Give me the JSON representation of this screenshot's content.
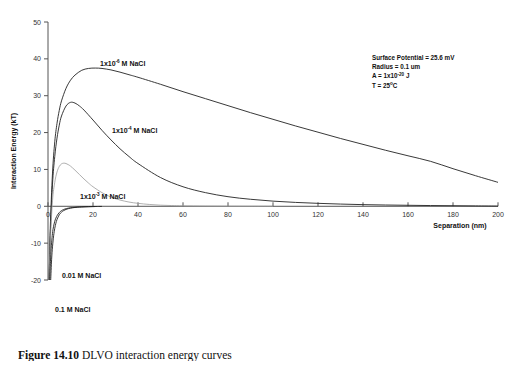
{
  "figure": {
    "caption_label": "Figure 14.10",
    "caption_text": "  DLVO interaction energy curves"
  },
  "chart_data": {
    "type": "line",
    "title": "",
    "xlabel": "Separation (nm)",
    "ylabel": "Interaction Energy (kT)",
    "xlim": [
      0,
      200
    ],
    "ylim": [
      -20,
      50
    ],
    "xticks": [
      0,
      20,
      40,
      60,
      80,
      100,
      120,
      140,
      160,
      180,
      200
    ],
    "yticks": [
      -20,
      -10,
      0,
      10,
      20,
      30,
      40,
      50
    ],
    "grid": false,
    "legend_position": "inline-annotations",
    "series": [
      {
        "name": "1x10-6 M NaCl",
        "label_html": "1x10<sup>-6</sup> M NaCl",
        "color": "#222222",
        "x": [
          0.5,
          1,
          2,
          3,
          4,
          5,
          6,
          8,
          10,
          12,
          15,
          18,
          21,
          24,
          28,
          32,
          36,
          40,
          50,
          60,
          70,
          80,
          90,
          100,
          110,
          120,
          130,
          140,
          150,
          160,
          170,
          180,
          190,
          200
        ],
        "y": [
          -20,
          -6,
          9,
          17.5,
          22.5,
          26,
          28.6,
          32,
          34.2,
          35.6,
          36.9,
          37.4,
          37.5,
          37.4,
          37.0,
          36.4,
          35.7,
          35.0,
          33.1,
          31.1,
          29.2,
          27.3,
          25.4,
          23.6,
          21.8,
          20.1,
          18.4,
          16.8,
          15.2,
          13.7,
          12.2,
          10.2,
          8.3,
          6.5
        ]
      },
      {
        "name": "1x10-4 M NaCl",
        "label_html": "1x10<sup>-4</sup> M NaCl",
        "color": "#222222",
        "x": [
          0.5,
          1,
          2,
          3,
          4,
          5,
          6,
          8,
          10,
          12,
          14,
          16,
          20,
          24,
          28,
          32,
          36,
          40,
          50,
          60,
          70,
          80,
          90,
          100,
          110,
          120,
          130,
          140,
          150,
          160,
          170,
          180,
          190,
          200
        ],
        "y": [
          -20,
          -8,
          6,
          13.5,
          18.5,
          22,
          24.5,
          27.2,
          28.2,
          28.0,
          27.2,
          26.1,
          23.4,
          20.6,
          18.0,
          15.6,
          13.5,
          11.6,
          7.8,
          5.3,
          3.7,
          2.6,
          1.9,
          1.4,
          1.05,
          0.8,
          0.6,
          0.45,
          0.35,
          0.27,
          0.2,
          0.15,
          0.1,
          0.05
        ]
      },
      {
        "name": "1x10-3 M NaCl",
        "label_html": "1x10<sup>-3</sup> M NaCl",
        "color": "#9a9a9a",
        "x": [
          0.5,
          1,
          2,
          3,
          4,
          5,
          6,
          7,
          8,
          9,
          10,
          12,
          14,
          16,
          18,
          20,
          24,
          28,
          32,
          36,
          40,
          45,
          50,
          55,
          60,
          70,
          80,
          90,
          100
        ],
        "y": [
          -20,
          -10,
          1.5,
          6.5,
          9.3,
          10.8,
          11.5,
          11.7,
          11.6,
          11.3,
          10.9,
          9.8,
          8.6,
          7.4,
          6.3,
          5.3,
          3.7,
          2.5,
          1.7,
          1.15,
          0.8,
          0.5,
          0.3,
          0.2,
          0.13,
          0.06,
          0.03,
          0.01,
          0.0
        ]
      },
      {
        "name": "0.01 M NaCl",
        "label_html": "0.01 M NaCl",
        "color": "#222222",
        "x": [
          1.2,
          1.6,
          2,
          2.5,
          3,
          3.5,
          4,
          5,
          6,
          7,
          8,
          9,
          10,
          11,
          12,
          13,
          14,
          16,
          18,
          20,
          22,
          24
        ],
        "y": [
          -20,
          -14.5,
          -11,
          -8,
          -6,
          -4.6,
          -3.6,
          -2.3,
          -1.6,
          -1.15,
          -0.85,
          -0.65,
          -0.5,
          -0.4,
          -0.32,
          -0.26,
          -0.21,
          -0.14,
          -0.1,
          -0.07,
          -0.05,
          -0.03
        ]
      },
      {
        "name": "0.1 M NaCl",
        "label_html": "0.1 M NaCl",
        "color": "#222222",
        "x": [
          0.8,
          1.1,
          1.4,
          1.8,
          2.2,
          2.7,
          3.2,
          3.8,
          4.5,
          5.5,
          6.5,
          7.5,
          9,
          11,
          13,
          15,
          18,
          21
        ],
        "y": [
          -20,
          -15,
          -11.5,
          -8.5,
          -6.4,
          -4.8,
          -3.7,
          -2.8,
          -2.1,
          -1.4,
          -1.0,
          -0.75,
          -0.5,
          -0.33,
          -0.23,
          -0.17,
          -0.11,
          -0.07
        ]
      }
    ],
    "annotations": [
      {
        "name": "surface-potential",
        "text": "Surface Potential = 25.6 mV"
      },
      {
        "name": "radius",
        "text": "Radius = 0.1 um"
      },
      {
        "name": "hamaker-constant",
        "text": "A = 1x10",
        "sup": "-20",
        "tail": " J"
      },
      {
        "name": "temperature",
        "text": "T = 25",
        "sup": "o",
        "tail": "C"
      }
    ]
  }
}
